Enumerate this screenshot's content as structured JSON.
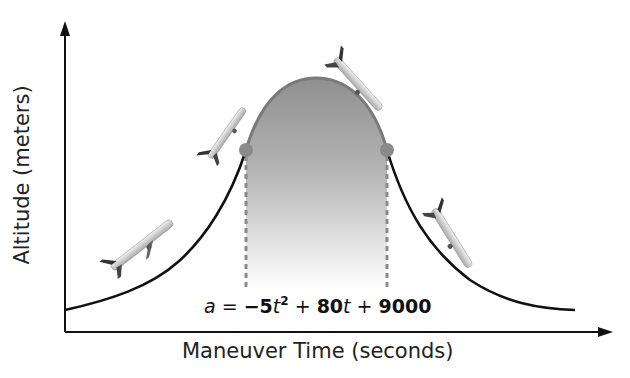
{
  "diagram": {
    "y_axis_label": "Altitude (meters)",
    "x_axis_label": "Maneuver Time (seconds)",
    "equation": {
      "lhs": "a",
      "eq": " = ",
      "neg": "−",
      "coef1": "5",
      "var1": "t",
      "exp1": "2",
      "plus1": " + ",
      "coef2": "80",
      "var2": "t",
      "plus2": " + ",
      "const": "9000"
    },
    "colors": {
      "axis": "#111111",
      "curve": "#111111",
      "parabola_fill_top": "#8f8f8f",
      "parabola_fill_bottom": "#ffffff",
      "parabola_edge": "#7a7a7a",
      "marker_dot": "#8a8a8a",
      "dashed_line": "#8a8a8a"
    },
    "airplane_icons": [
      "airplane-climbing",
      "airplane-climbing-steep",
      "airplane-nose-over",
      "airplane-descending"
    ]
  }
}
